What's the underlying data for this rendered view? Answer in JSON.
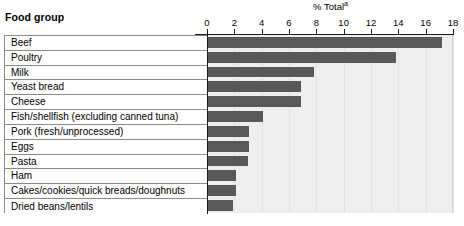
{
  "header": {
    "food_group_label": "Food group",
    "axis_title": "% Total",
    "axis_title_footnote": "a"
  },
  "colors": {
    "bar_fill": "#585858",
    "plot_background": "#eeeeee",
    "gridline": "#e2e2e2",
    "table_border": "#8a8a8a",
    "axis": "#1a1a1a"
  },
  "chart_data": {
    "type": "bar",
    "orientation": "horizontal",
    "title": "",
    "xlabel": "% Total",
    "ylabel": "Food group",
    "xlim": [
      0,
      18
    ],
    "xticks": [
      0,
      2,
      4,
      6,
      8,
      10,
      12,
      14,
      16,
      18
    ],
    "xtick_labels": [
      "0",
      "2",
      "4",
      "6",
      "8",
      "10",
      "12",
      "14",
      "16",
      "18"
    ],
    "grid": true,
    "legend": false,
    "annotations": [
      "a"
    ],
    "categories": [
      "Beef",
      "Poultry",
      "Milk",
      "Yeast bread",
      "Cheese",
      "Fish/shellfish (excluding canned tuna)",
      "Pork (fresh/unprocessed)",
      "Eggs",
      "Pasta",
      "Ham",
      "Cakes/cookies/quick breads/doughnuts",
      "Dried beans/lentils"
    ],
    "values": [
      17.2,
      13.8,
      7.8,
      6.9,
      6.9,
      4.1,
      3.1,
      3.1,
      3.0,
      2.1,
      2.1,
      1.9
    ]
  }
}
